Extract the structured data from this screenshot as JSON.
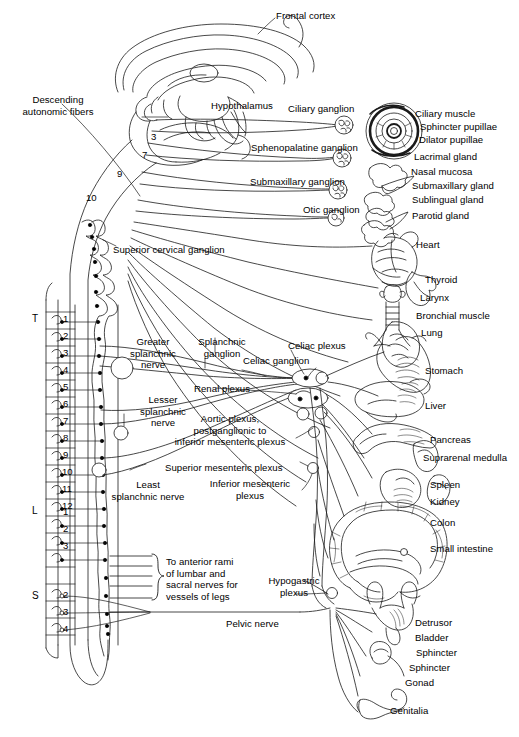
{
  "figure": {
    "domain": "anatomical-diagram"
  },
  "labels": {
    "frontal_cortex": "Frontal cortex",
    "hypothalamus": "Hypothalamus",
    "descending_autonomic_fibers": "Descending\nautonomic fibers",
    "ciliary_ganglion": "Ciliary ganglion",
    "sphenopalatine_ganglion": "Sphenopalatine ganglion",
    "submaxillary_ganglion": "Submaxillary ganglion",
    "otic_ganglion": "Otic ganglion",
    "superior_cervical_ganglion": "Superior cervical ganglion",
    "greater_splanchnic_nerve": "Greater\nsplanchnic\nnerve",
    "lesser_splanchnic_nerve": "Lesser\nsplanchnic\nnerve",
    "least_splanchnic_nerve": "Least\nsplanchnic nerve",
    "splanchnic_ganglion": "Splanchnic\nganglion",
    "celiac_plexus": "Celiac plexus",
    "celiac_ganglion": "Celiac ganglion",
    "renal_plexus": "Renal plexus",
    "aortic_plexus": "Aortic plexus,\npostganglionic to\ninferior mesenteric plexus",
    "superior_mesenteric_plexus": "Superior mesenteric plexus",
    "inferior_mesenteric_plexus": "Inferior mesenteric\nplexus",
    "to_anterior_rami": "To anterior rami\nof lumbar and\nsacral nerves for\nvessels of legs",
    "hypogastric_plexus": "Hypogastric\nplexus",
    "pelvic_nerve": "Pelvic nerve"
  },
  "cranial_nerve_numbers": [
    "3",
    "7",
    "9",
    "10"
  ],
  "spinal_regions": [
    {
      "code": "T",
      "name": "Thoracic",
      "segments": [
        "1",
        "2",
        "3",
        "4",
        "5",
        "6",
        "7",
        "8",
        "9",
        "10",
        "11",
        "12"
      ]
    },
    {
      "code": "L",
      "name": "Lumbar",
      "segments": [
        "1",
        "2",
        "3"
      ]
    },
    {
      "code": "S",
      "name": "Sacral",
      "segments": [
        "2",
        "3",
        "4"
      ]
    }
  ],
  "target_organs": [
    "Ciliary muscle",
    "Sphincter pupillae",
    "Dilator pupillae",
    "Lacrimal gland",
    "Nasal mucosa",
    "Submaxillary gland",
    "Sublingual gland",
    "Parotid gland",
    "Heart",
    "Thyroid",
    "Larynx",
    "Bronchial muscle",
    "Lung",
    "Stomach",
    "Liver",
    "Pancreas",
    "Suprarenal medulla",
    "Spleen",
    "Kidney",
    "Colon",
    "Small intestine",
    "Detrusor",
    "Bladder",
    "Sphincter",
    "Sphincter",
    "Gonad",
    "Genitalia"
  ],
  "colors": {
    "ink": "#000000",
    "paper": "#ffffff"
  }
}
